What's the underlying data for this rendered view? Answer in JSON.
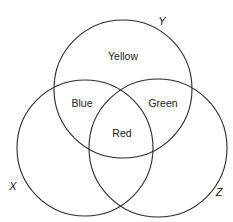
{
  "diagram": {
    "type": "venn",
    "sets": [
      {
        "name": "Y",
        "label": "Y",
        "cx": 123,
        "cy": 89,
        "r": 69,
        "label_x": 162,
        "label_y": 25
      },
      {
        "name": "X",
        "label": "X",
        "cx": 85,
        "cy": 148,
        "r": 68,
        "label_x": 13,
        "label_y": 190
      },
      {
        "name": "Z",
        "label": "Z",
        "cx": 158,
        "cy": 148,
        "r": 69,
        "label_x": 219,
        "label_y": 196
      }
    ],
    "regions": [
      {
        "id": "yellow",
        "label": "Yellow",
        "sets": [
          "Y"
        ],
        "x": 123,
        "y": 60
      },
      {
        "id": "blue",
        "label": "Blue",
        "sets": [
          "X",
          "Y"
        ],
        "x": 82,
        "y": 107
      },
      {
        "id": "green",
        "label": "Green",
        "sets": [
          "Y",
          "Z"
        ],
        "x": 163,
        "y": 107
      },
      {
        "id": "red",
        "label": "Red",
        "sets": [
          "X",
          "Y",
          "Z"
        ],
        "x": 122,
        "y": 137
      }
    ],
    "stroke_color": "#2b2b2b",
    "background": "#ffffff"
  }
}
